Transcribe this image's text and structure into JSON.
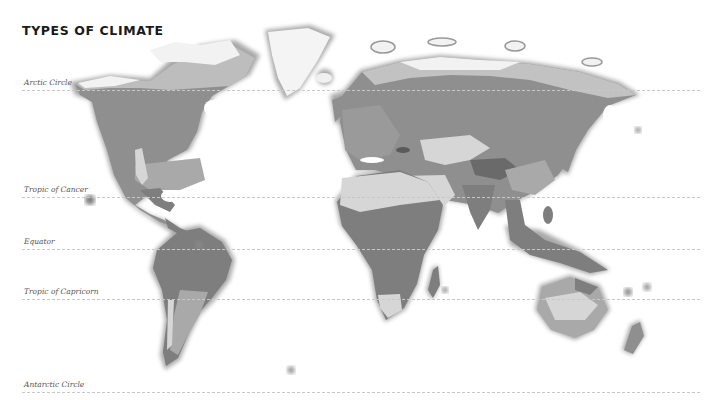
{
  "title": "TYPES OF CLIMATE",
  "latitude_lines": [
    {
      "id": "arctic",
      "label": "Arctic Circle",
      "y": 90
    },
    {
      "id": "cancer",
      "label": "Tropic of Cancer",
      "y": 197
    },
    {
      "id": "equator",
      "label": "Equator",
      "y": 249
    },
    {
      "id": "capricorn",
      "label": "Tropic of Capricorn",
      "y": 299
    },
    {
      "id": "antarctic",
      "label": "Antarctic Circle",
      "y": 392
    }
  ],
  "colors": {
    "background": "#ffffff",
    "polar_ice": "#f4f4f4",
    "tundra": "#bdbdbd",
    "cold_forest": "#8f8f8f",
    "temperate": "#a9a9a9",
    "dry_desert": "#d6d6d6",
    "tropical": "#7e7e7e",
    "mountain": "#6a6a6a",
    "outline_glow": "#9a9a9a"
  }
}
